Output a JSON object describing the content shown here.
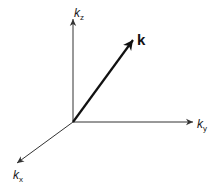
{
  "diagram": {
    "title": "",
    "origin": [
      73,
      122
    ],
    "axes": [
      {
        "name": "kz",
        "label_base": "k",
        "label_sub": "z",
        "end": [
          73,
          18
        ]
      },
      {
        "name": "ky",
        "label_base": "k",
        "label_sub": "y",
        "end": [
          194,
          122
        ]
      },
      {
        "name": "kx",
        "label_base": "k",
        "label_sub": "x",
        "end": [
          16,
          164
        ]
      }
    ],
    "vector": {
      "label": "k",
      "end": [
        134,
        39
      ],
      "bold": true
    },
    "colors": {
      "axis": "#333333",
      "vector": "#111111",
      "background": "#ffffff"
    }
  }
}
